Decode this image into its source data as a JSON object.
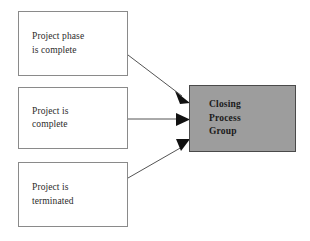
{
  "diagram": {
    "type": "flow-diagram",
    "colors": {
      "source_box_fill": "#ffffff",
      "source_box_border": "#8a8a8a",
      "target_box_fill": "#9d9d9d",
      "target_box_border": "#4a4a4a",
      "arrow": "#545454",
      "arrowhead": "#111111",
      "text": "#2b2b2b",
      "background": "#ffffff"
    },
    "source_boxes": [
      {
        "id": "phase-complete",
        "label": "Project phase\nis complete"
      },
      {
        "id": "project-complete",
        "label": "Project is\ncomplete"
      },
      {
        "id": "project-terminated",
        "label": "Project is\nterminated"
      }
    ],
    "target_box": {
      "id": "closing-process-group",
      "label": "Closing\nProcess\nGroup"
    },
    "connectors": [
      {
        "id": "arrow-phase-complete",
        "from": "phase-complete",
        "to": "closing-process-group",
        "direction": "down-right"
      },
      {
        "id": "arrow-project-complete",
        "from": "project-complete",
        "to": "closing-process-group",
        "direction": "right"
      },
      {
        "id": "arrow-project-terminated",
        "from": "project-terminated",
        "to": "closing-process-group",
        "direction": "up-right"
      }
    ]
  }
}
